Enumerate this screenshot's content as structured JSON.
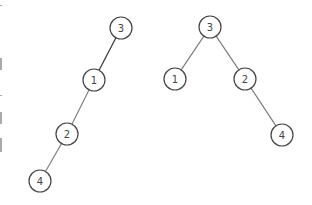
{
  "diagram": {
    "type": "binary-trees",
    "trees": [
      {
        "name": "left-tree",
        "nodes": [
          {
            "id": "L3",
            "label": "3",
            "x": 121,
            "y": 28
          },
          {
            "id": "L1",
            "label": "1",
            "x": 94,
            "y": 80
          },
          {
            "id": "L2",
            "label": "2",
            "x": 67,
            "y": 134
          },
          {
            "id": "L4",
            "label": "4",
            "x": 40,
            "y": 181
          }
        ],
        "edges": [
          [
            "L3",
            "L1"
          ],
          [
            "L1",
            "L2"
          ],
          [
            "L2",
            "L4"
          ]
        ]
      },
      {
        "name": "right-tree",
        "nodes": [
          {
            "id": "R3",
            "label": "3",
            "x": 210,
            "y": 27
          },
          {
            "id": "R1",
            "label": "1",
            "x": 175,
            "y": 79
          },
          {
            "id": "R2",
            "label": "2",
            "x": 245,
            "y": 79
          },
          {
            "id": "R4",
            "label": "4",
            "x": 282,
            "y": 135
          }
        ],
        "edges": [
          [
            "R3",
            "R1"
          ],
          [
            "R3",
            "R2"
          ],
          [
            "R2",
            "R4"
          ]
        ]
      }
    ],
    "colors": {
      "node_stroke": "#444444",
      "edge": "#777777",
      "background": "#ffffff"
    }
  }
}
